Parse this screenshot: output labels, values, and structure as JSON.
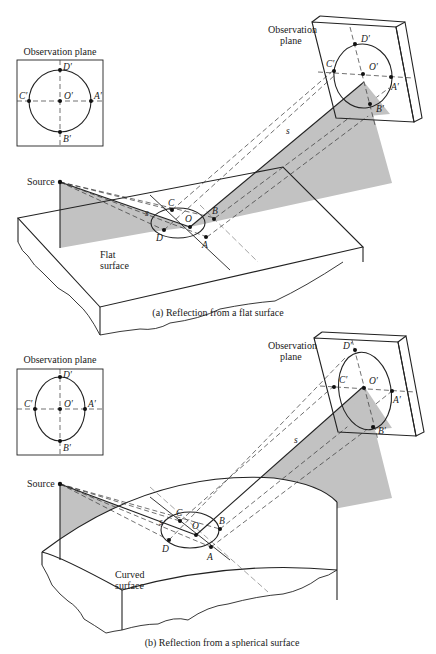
{
  "figure_a": {
    "caption": "(a)  Reflection from a flat surface",
    "inset_title": "Observation plane",
    "inset_points": {
      "top": "D′",
      "left": "C′",
      "center": "O′",
      "right": "A′",
      "bottom": "B′"
    },
    "inset_shape": "circle",
    "plane_label_line1": "Observation",
    "plane_label_line2": "plane",
    "plane_points": {
      "top": "D′",
      "left": "C′",
      "center": "O′",
      "right": "A′",
      "bottom": "B′"
    },
    "source_label": "Source",
    "surface_label_line1": "Flat",
    "surface_label_line2": "surface",
    "surface_points": {
      "c": "C",
      "o": "O",
      "b": "B",
      "d": "D",
      "a": "A"
    },
    "ray_label": "s"
  },
  "figure_b": {
    "caption": "(b)  Reflection from a spherical surface",
    "inset_title": "Observation plane",
    "inset_points": {
      "top": "D′",
      "left": "C′",
      "center": "O′",
      "right": "A′",
      "bottom": "B′"
    },
    "inset_shape": "vertical ellipse",
    "plane_label_line1": "Observation",
    "plane_label_line2": "plane",
    "plane_points": {
      "top": "D′",
      "left": "C′",
      "center": "O′",
      "right": "A′",
      "bottom": "B′"
    },
    "source_label": "Source",
    "surface_label_line1": "Curved",
    "surface_label_line2": "surface",
    "surface_points": {
      "c": "C",
      "o": "O",
      "b": "B",
      "d": "D",
      "a": "A"
    },
    "ray_label": "s"
  }
}
